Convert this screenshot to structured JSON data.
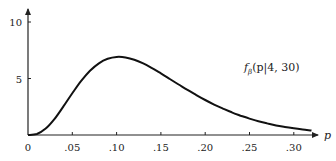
{
  "chart_data": {
    "type": "line",
    "title": "",
    "xlabel": "p",
    "ylabel": "",
    "xlim": [
      0,
      0.32
    ],
    "ylim": [
      0,
      10
    ],
    "grid": false,
    "x_ticks": [
      {
        "value": 0,
        "label": "0"
      },
      {
        "value": 0.05,
        "label": ".05"
      },
      {
        "value": 0.1,
        "label": ".10"
      },
      {
        "value": 0.15,
        "label": ".15"
      },
      {
        "value": 0.2,
        "label": ".20"
      },
      {
        "value": 0.25,
        "label": ".25"
      },
      {
        "value": 0.3,
        "label": ".30"
      }
    ],
    "y_ticks": [
      {
        "value": 5,
        "label": "5"
      },
      {
        "value": 10,
        "label": "10"
      }
    ],
    "annotation": {
      "func": "f",
      "sub": "β",
      "args": "(p|4, 30)"
    },
    "series": [
      {
        "name": "f_beta(p|4, 30)",
        "x": [
          0,
          0.01,
          0.02,
          0.03,
          0.04,
          0.05,
          0.06,
          0.07,
          0.08,
          0.09,
          0.1,
          0.11,
          0.12,
          0.13,
          0.14,
          0.15,
          0.16,
          0.17,
          0.18,
          0.19,
          0.2,
          0.21,
          0.22,
          0.23,
          0.24,
          0.25,
          0.26,
          0.27,
          0.28,
          0.29,
          0.3,
          0.31,
          0.32
        ],
        "values": [
          0,
          0.085,
          0.52,
          1.31,
          2.32,
          3.39,
          4.39,
          5.22,
          5.82,
          6.19,
          6.34,
          6.3,
          6.11,
          5.81,
          5.43,
          5.0,
          4.55,
          4.1,
          3.66,
          3.24,
          2.84,
          2.47,
          2.14,
          1.84,
          1.57,
          1.33,
          1.12,
          0.94,
          0.78,
          0.65,
          0.54,
          0.44,
          0.36
        ]
      }
    ]
  }
}
